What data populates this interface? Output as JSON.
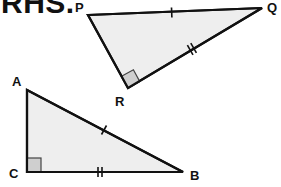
{
  "heading": "RHS.",
  "triangles": [
    {
      "name": "PQR",
      "vertices": {
        "P": {
          "label": "P",
          "x": 88,
          "y": 15
        },
        "Q": {
          "label": "Q",
          "x": 262,
          "y": 8
        },
        "R": {
          "label": "R",
          "x": 128,
          "y": 88
        }
      },
      "right_angle_at": "R",
      "marks": {
        "PQ": "single tick (hypotenuse)",
        "QR": "double tick"
      }
    },
    {
      "name": "ABC",
      "vertices": {
        "A": {
          "label": "A",
          "x": 27,
          "y": 90
        },
        "B": {
          "label": "B",
          "x": 183,
          "y": 172
        },
        "C": {
          "label": "C",
          "x": 27,
          "y": 172
        }
      },
      "right_angle_at": "C",
      "marks": {
        "AB": "single tick (hypotenuse)",
        "CB": "double tick"
      }
    }
  ],
  "colors": {
    "fill": "#eeeeee",
    "stroke": "#111111",
    "right_angle_fill": "#cfcfcf"
  }
}
